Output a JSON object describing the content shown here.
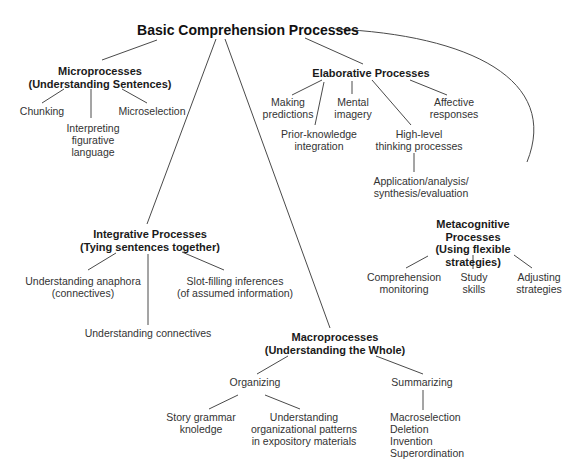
{
  "diagram": {
    "title": "Basic Comprehension Processes",
    "nodes": {
      "root": "Basic Comprehension Processes",
      "micro": "Microprocesses\n(Understanding Sentences)",
      "chunking": "Chunking",
      "interpreting": "Interpreting\nfigurative\nlanguage",
      "microselection": "Microselection",
      "elab": "Elaborative Processes",
      "making": "Making\npredictions",
      "prior": "Prior-knowledge\nintegration",
      "mental": "Mental\nimagery",
      "highlevel": "High-level\nthinking processes",
      "affective": "Affective\nresponses",
      "application": "Application/analysis/\nsynthesis/evaluation",
      "integ": "Integrative Processes\n(Tying sentences together)",
      "anaphora": "Understanding anaphora\n(connectives)",
      "slot": "Slot-filling inferences\n(of assumed information)",
      "connectives": "Understanding connectives",
      "meta": "Metacognitive\nProcesses\n(Using flexible strategies)",
      "comprehension": "Comprehension\nmonitoring",
      "study": "Study\nskills",
      "adjusting": "Adjusting\nstrategies",
      "macro": "Macroprocesses\n(Understanding the Whole)",
      "organizing": "Organizing",
      "summarizing": "Summarizing",
      "story": "Story grammar\nknoledge",
      "patterns": "Understanding\norganizational patterns\nin expository materials",
      "summary_list": "Macroselection\nDeletion\nInvention\nSuperordination"
    },
    "edges": [
      [
        "root",
        "micro"
      ],
      [
        "root",
        "elab"
      ],
      [
        "root",
        "integ"
      ],
      [
        "root",
        "macro"
      ],
      [
        "root",
        "meta"
      ],
      [
        "micro",
        "chunking"
      ],
      [
        "micro",
        "interpreting"
      ],
      [
        "micro",
        "microselection"
      ],
      [
        "elab",
        "making"
      ],
      [
        "elab",
        "prior"
      ],
      [
        "elab",
        "mental"
      ],
      [
        "elab",
        "highlevel"
      ],
      [
        "elab",
        "affective"
      ],
      [
        "highlevel",
        "application"
      ],
      [
        "integ",
        "anaphora"
      ],
      [
        "integ",
        "connectives"
      ],
      [
        "integ",
        "slot"
      ],
      [
        "meta",
        "comprehension"
      ],
      [
        "meta",
        "study"
      ],
      [
        "meta",
        "adjusting"
      ],
      [
        "macro",
        "organizing"
      ],
      [
        "macro",
        "summarizing"
      ],
      [
        "organizing",
        "story"
      ],
      [
        "organizing",
        "patterns"
      ],
      [
        "summarizing",
        "summary_list"
      ]
    ],
    "colors": {
      "line": "#4a4a4a",
      "text": "#333333",
      "heading": "#111111",
      "background": "#ffffff"
    }
  }
}
